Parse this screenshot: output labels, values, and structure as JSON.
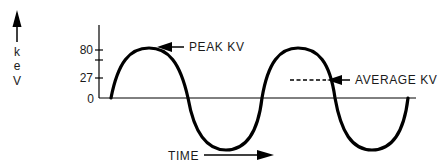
{
  "diagram": {
    "title": "",
    "y_axis": {
      "unit_label": [
        "k",
        "e",
        "V"
      ],
      "ticks": [
        {
          "label": "80",
          "value": 80
        },
        {
          "label": "",
          "value": 70
        },
        {
          "label": "27",
          "value": 27
        },
        {
          "label": "0",
          "value": 0
        }
      ]
    },
    "x_axis": {
      "label": "TIME"
    },
    "annotations": {
      "peak": "PEAK KV",
      "average": "AVERAGE KV"
    },
    "colors": {
      "stroke": "#000000",
      "text": "#1a1a1a",
      "background": "#ffffff"
    }
  }
}
